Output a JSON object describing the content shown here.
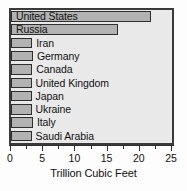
{
  "chart_data": {
    "type": "bar",
    "orientation": "horizontal",
    "title": "",
    "xlabel": "Trillion Cubic Feet",
    "ylabel": "",
    "xlim": [
      0,
      25
    ],
    "grid": false,
    "legend": null,
    "categories": [
      "United States",
      "Russia",
      "Iran",
      "Germany",
      "Canada",
      "United Kingdom",
      "Japan",
      "Ukraine",
      "Italy",
      "Saudi Arabia"
    ],
    "values": [
      21.8,
      16.6,
      3.3,
      3.4,
      3.3,
      3.2,
      3.2,
      3.2,
      3.4,
      3.2
    ],
    "xticks": [
      0,
      5,
      10,
      15,
      20,
      25
    ],
    "xtick_labels": [
      "0",
      "5",
      "10",
      "15",
      "20",
      "25"
    ],
    "minor_xticks": [
      2.5,
      7.5,
      12.5,
      17.5,
      22.5
    ],
    "label_placement": [
      "inside",
      "inside",
      "outside",
      "outside",
      "outside",
      "outside",
      "outside",
      "outside",
      "outside",
      "outside"
    ],
    "colors": {
      "bar_fill": "#b2b2b2",
      "bar_edge": "#2e2e2e",
      "plot_background": "#e9e9e9",
      "plot_border": "#3a3a3a",
      "text": "#111111",
      "axis": "#2e2e2e"
    }
  }
}
